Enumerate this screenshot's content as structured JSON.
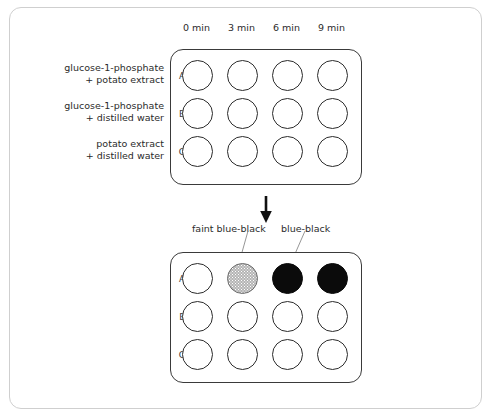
{
  "figure": {
    "colors": {
      "frame": "#cfcfcf",
      "outline": "#3a3a3a",
      "faint_well": "#b4b4b4",
      "dark_well": "#0b0b0b",
      "text": "#2b2b2b"
    }
  },
  "columns": [
    {
      "label": "0 min"
    },
    {
      "label": "3 min"
    },
    {
      "label": "6 min"
    },
    {
      "label": "9 min"
    }
  ],
  "treatments": [
    {
      "row": "A",
      "line1": "glucose-1-phosphate",
      "line2": "+ potato extract"
    },
    {
      "row": "B",
      "line1": "glucose-1-phosphate",
      "line2": "+ distilled water"
    },
    {
      "row": "C",
      "line1": "potato extract",
      "line2": "+ distilled water"
    }
  ],
  "plate_before": {
    "name": "before plate",
    "row_labels": [
      "A",
      "B",
      "C"
    ],
    "wells": [
      [
        "empty",
        "empty",
        "empty",
        "empty"
      ],
      [
        "empty",
        "empty",
        "empty",
        "empty"
      ],
      [
        "empty",
        "empty",
        "empty",
        "empty"
      ]
    ]
  },
  "plate_after": {
    "name": "after plate",
    "row_labels": [
      "A",
      "E",
      "C"
    ],
    "wells": [
      [
        "empty",
        "faint",
        "dark",
        "dark"
      ],
      [
        "empty",
        "empty",
        "empty",
        "empty"
      ],
      [
        "empty",
        "empty",
        "empty",
        "empty"
      ]
    ]
  },
  "annotations": {
    "faint_label": "faint blue-black",
    "dark_label": "blue-black",
    "arrow": "down-arrow"
  }
}
